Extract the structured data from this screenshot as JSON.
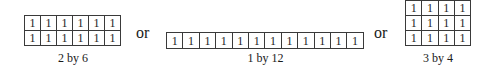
{
  "arrangements": [
    {
      "label": "2 by 6",
      "rows": 2,
      "cols": 6,
      "cells": [
        [
          "1",
          "1",
          "1",
          "1",
          "1",
          "1"
        ],
        [
          "1",
          "1",
          "1",
          "1",
          "1",
          "1"
        ]
      ]
    },
    {
      "label": "1 by 12",
      "rows": 1,
      "cols": 12,
      "cells": [
        [
          "1",
          "1",
          "1",
          "1",
          "1",
          "1",
          "1",
          "1",
          "1",
          "1",
          "1",
          "1"
        ]
      ]
    },
    {
      "label": "3 by 4",
      "rows": 3,
      "cols": 4,
      "cells": [
        [
          "1",
          "1",
          "1",
          "1"
        ],
        [
          "1",
          "1",
          "1",
          "1"
        ],
        [
          "1",
          "1",
          "1",
          "1"
        ]
      ]
    }
  ],
  "separators": [
    "or",
    "or"
  ]
}
